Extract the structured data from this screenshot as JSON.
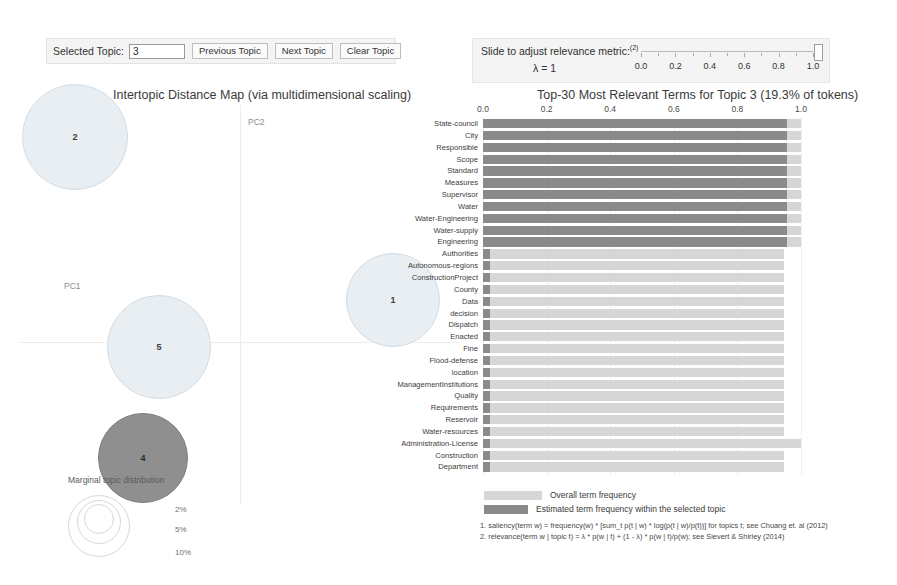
{
  "topic_control": {
    "label": "Selected Topic:",
    "value": "3",
    "placeholder": "",
    "previous_label": "Previous Topic",
    "next_label": "Next Topic",
    "clear_label": "Clear Topic"
  },
  "lambda_panel": {
    "title": "Slide to adjust relevance metric:",
    "title_sup": "(2)",
    "value_text": "λ = 1",
    "lambda": 1.0,
    "tick_labels": [
      "0.0",
      "0.2",
      "0.4",
      "0.6",
      "0.8",
      "1.0"
    ],
    "tick_values": [
      0.0,
      0.2,
      0.4,
      0.6,
      0.8,
      1.0
    ]
  },
  "map": {
    "title": "Intertopic Distance Map (via multidimensional scaling)",
    "axis_x_label": "PC1",
    "axis_y_label": "PC2",
    "marginal_label": "Marginal topic distribution",
    "size_legend": [
      "2%",
      "5%",
      "10%"
    ],
    "colors": {
      "bubble_fill": "#e8eef2",
      "bubble_stroke": "#d3dde4",
      "selected_fill": "#8f8f8f",
      "selected_stroke": "#7d7d7d"
    },
    "topics": [
      {
        "label": "2",
        "cx": 55,
        "cy": 32,
        "r": 53,
        "selected": false
      },
      {
        "label": "5",
        "cx": 139,
        "cy": 242,
        "r": 52,
        "selected": false
      },
      {
        "label": "1",
        "cx": 373,
        "cy": 195,
        "r": 47,
        "selected": false
      },
      {
        "label": "4",
        "cx": 123,
        "cy": 353,
        "r": 45,
        "selected": true
      }
    ]
  },
  "chart_data": {
    "type": "bar",
    "title": "Top-30 Most Relevant Terms for Topic 3 (19.3% of tokens)",
    "topic_number": 3,
    "token_share_pct": 19.3,
    "xlabel": "",
    "ylabel": "",
    "xlim": [
      0.0,
      1.0
    ],
    "grid": true,
    "legend_position": "bottom",
    "xticks": [
      0.0,
      0.2,
      0.4,
      0.6,
      0.8,
      1.0
    ],
    "xtick_labels": [
      "0.0",
      "0.2",
      "0.4",
      "0.6",
      "0.8",
      "1.0"
    ],
    "categories": [
      "State-council",
      "City",
      "Responsible",
      "Scope",
      "Standard",
      "Measures",
      "Supervisor",
      "Water",
      "Water-Engineering",
      "Water-supply",
      "Engineering",
      "Authorities",
      "Autonomous-regions",
      "ConstructionProject",
      "County",
      "Data",
      "decision",
      "Dispatch",
      "Enacted",
      "Fine",
      "Flood-defense",
      "location",
      "ManagementInstitutions",
      "Quality",
      "Requirements",
      "Reservoir",
      "Water-resources",
      "Administration-License",
      "Construction",
      "Department"
    ],
    "series": [
      {
        "name": "Overall term frequency",
        "color": "#d6d6d6",
        "values": [
          1.0,
          1.0,
          1.0,
          1.0,
          1.0,
          1.0,
          1.0,
          1.0,
          1.0,
          1.0,
          1.0,
          0.945,
          0.945,
          0.945,
          0.945,
          0.945,
          0.945,
          0.945,
          0.945,
          0.945,
          0.945,
          0.945,
          0.945,
          0.945,
          0.945,
          0.945,
          0.945,
          1.0,
          0.945,
          0.945
        ]
      },
      {
        "name": "Estimated term frequency within the selected topic",
        "color": "#8a8a8a",
        "values": [
          0.955,
          0.955,
          0.955,
          0.955,
          0.955,
          0.955,
          0.955,
          0.955,
          0.955,
          0.955,
          0.955,
          0.022,
          0.022,
          0.022,
          0.022,
          0.022,
          0.022,
          0.022,
          0.022,
          0.022,
          0.022,
          0.022,
          0.022,
          0.022,
          0.022,
          0.022,
          0.022,
          0.022,
          0.022,
          0.022
        ]
      }
    ]
  },
  "legend": {
    "overall": "Overall term frequency",
    "topic": "Estimated term frequency within the selected topic"
  },
  "footnotes": {
    "one": "1. saliency(term w) = frequency(w) * [sum_t p(t | w) * log(p(t | w)/p(t))] for topics t; see Chuang et. al (2012)",
    "two": "2. relevance(term w | topic t) = λ * p(w | t) + (1 - λ) * p(w | t)/p(w); see Sievert & Shirley (2014)"
  }
}
